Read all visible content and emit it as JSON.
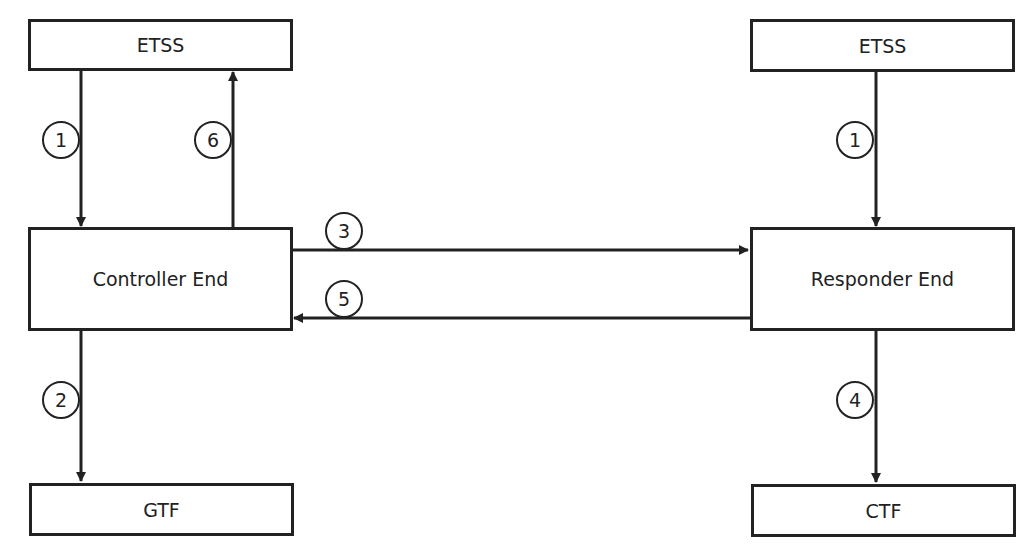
{
  "nodes": {
    "etss_left": {
      "label": "ETSS"
    },
    "controller": {
      "label": "Controller End"
    },
    "gtf": {
      "label": "GTF"
    },
    "etss_right": {
      "label": "ETSS"
    },
    "responder": {
      "label": "Responder End"
    },
    "ctf": {
      "label": "CTF"
    }
  },
  "edges": [
    {
      "id": "e1-left",
      "step": "1",
      "from": "ETSS (left)",
      "to": "Controller End"
    },
    {
      "id": "e6",
      "step": "6",
      "from": "Controller End",
      "to": "ETSS (left)"
    },
    {
      "id": "e2",
      "step": "2",
      "from": "Controller End",
      "to": "GTF"
    },
    {
      "id": "e3",
      "step": "3",
      "from": "Controller End",
      "to": "Responder End"
    },
    {
      "id": "e5",
      "step": "5",
      "from": "Responder End",
      "to": "Controller End"
    },
    {
      "id": "e1-right",
      "step": "1",
      "from": "ETSS (right)",
      "to": "Responder End"
    },
    {
      "id": "e4",
      "step": "4",
      "from": "Responder End",
      "to": "CTF"
    }
  ],
  "colors": {
    "stroke": "#222222",
    "background": "#ffffff"
  }
}
